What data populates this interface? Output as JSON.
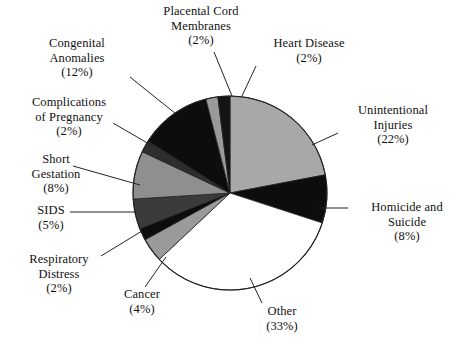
{
  "chart_data": {
    "type": "pie",
    "title": "",
    "subtitle": "",
    "legend_position": "callout-labels",
    "total_percent": 100,
    "start_angle_deg": 0,
    "direction": "clockwise",
    "categories": [
      "Unintentional Injuries",
      "Homicide and Suicide",
      "Other",
      "Cancer",
      "Respiratory Distress",
      "SIDS",
      "Short Gestation",
      "Complications of Pregnancy",
      "Congenital Anomalies",
      "Placental Cord Membranes",
      "Heart Disease"
    ],
    "values": [
      22,
      8,
      33,
      4,
      2,
      5,
      8,
      2,
      12,
      2,
      2
    ],
    "slices": [
      {
        "label": "Unintentional Injuries",
        "value": 22,
        "pct_text": "(22%)",
        "color": "#a8a8a8"
      },
      {
        "label": "Homicide and Suicide",
        "value": 8,
        "pct_text": "(8%)",
        "color": "#0d0d0d"
      },
      {
        "label": "Other",
        "value": 33,
        "pct_text": "(33%)",
        "color": "#ffffff"
      },
      {
        "label": "Cancer",
        "value": 4,
        "pct_text": "(4%)",
        "color": "#9a9a9a"
      },
      {
        "label": "Respiratory Distress",
        "value": 2,
        "pct_text": "(2%)",
        "color": "#0d0d0d"
      },
      {
        "label": "SIDS",
        "value": 5,
        "pct_text": "(5%)",
        "color": "#3b3b3b"
      },
      {
        "label": "Short Gestation",
        "value": 8,
        "pct_text": "(8%)",
        "color": "#8f8f8f"
      },
      {
        "label": "Complications of Pregnancy",
        "value": 2,
        "pct_text": "(2%)",
        "color": "#2e2e2e"
      },
      {
        "label": "Congenital Anomalies",
        "value": 12,
        "pct_text": "(12%)",
        "color": "#0d0d0d"
      },
      {
        "label": "Placental Cord Membranes",
        "value": 2,
        "pct_text": "(2%)",
        "color": "#9a9a9a"
      },
      {
        "label": "Heart Disease",
        "value": 2,
        "pct_text": "(2%)",
        "color": "#141414"
      }
    ]
  },
  "labels": {
    "placental": {
      "line1": "Placental Cord",
      "line2": "Membranes",
      "pct": "(2%)"
    },
    "heart": {
      "line1": "Heart Disease",
      "line2": "",
      "pct": "(2%)"
    },
    "congenital": {
      "line1": "Congenital",
      "line2": "Anomalies",
      "pct": "(12%)"
    },
    "complications": {
      "line1": "Complications",
      "line2": "of Pregnancy",
      "pct": "(2%)"
    },
    "short": {
      "line1": "Short",
      "line2": "Gestation",
      "pct": "(8%)"
    },
    "sids": {
      "line1": "SIDS",
      "line2": "",
      "pct": "(5%)"
    },
    "respiratory": {
      "line1": "Respiratory",
      "line2": "Distress",
      "pct": "(2%)"
    },
    "cancer": {
      "line1": "Cancer",
      "line2": "",
      "pct": "(4%)"
    },
    "other": {
      "line1": "Other",
      "line2": "",
      "pct": "(33%)"
    },
    "unintentional": {
      "line1": "Unintentional",
      "line2": "Injuries",
      "pct": "(22%)"
    },
    "homicide": {
      "line1": "Homicide and",
      "line2": "Suicide",
      "pct": "(8%)"
    }
  },
  "colors": {
    "background": "#ffffff",
    "text": "#111111",
    "outline": "#222222",
    "leader_line": "#222222"
  },
  "geometry": {
    "center_x": 230,
    "center_y": 193,
    "radius": 97
  }
}
